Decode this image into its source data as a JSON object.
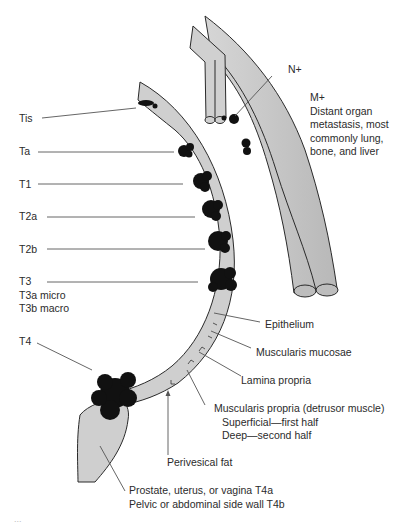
{
  "figure": {
    "stage_labels": {
      "tis": "Tis",
      "ta": "Ta",
      "t1": "T1",
      "t2a": "T2a",
      "t2b": "T2b",
      "t3": "T3",
      "t3a": "T3a micro",
      "t3b": "T3b macro",
      "t4": "T4"
    },
    "nodal": {
      "label": "N+"
    },
    "metastasis": {
      "title": "M+",
      "lines": [
        "Distant organ",
        "metastasis, most",
        "commonly lung,",
        "bone, and liver"
      ]
    },
    "layers": {
      "epithelium": "Epithelium",
      "muscularis_mucosae": "Muscularis mucosae",
      "lamina_propria": "Lamina propria",
      "muscularis_propria": "Muscularis propria (detrusor muscle)",
      "superficial": "Superficial—first half",
      "deep": "Deep—second half",
      "perivesical_fat": "Perivesical fat"
    },
    "t4_sites": {
      "t4a": "Prostate, uterus, or vagina T4a",
      "t4b": "Pelvic or abdominal side wall T4b"
    },
    "caption_fragment": "...",
    "colors": {
      "wall_fill": "#cfcfcf",
      "vessel_fill": "#c4c4c4",
      "tumor": "#111111",
      "outline": "#2a2a2a",
      "leader": "#555555"
    }
  }
}
